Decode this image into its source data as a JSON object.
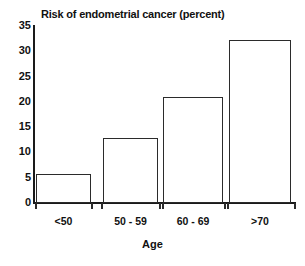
{
  "chart_data": {
    "type": "bar",
    "title": "Risk of endometrial cancer (percent)",
    "xlabel": "Age",
    "ylabel": "",
    "categories": [
      "<50",
      "50 - 59",
      "60 - 69",
      ">70"
    ],
    "values": [
      5.7,
      12.8,
      21.0,
      32.3
    ],
    "ylim": [
      0,
      35
    ],
    "yticks": [
      "0",
      "5",
      "10",
      "15",
      "20",
      "25",
      "30",
      "35"
    ],
    "ytick_values": [
      0,
      5,
      10,
      15,
      20,
      25,
      30,
      35
    ],
    "grid": false,
    "legend": false,
    "bar_fill_color": "#ffffff",
    "bar_edge_color": "#2b2b2b",
    "axis_color": "#1a1a1a",
    "background_color": "#ffffff"
  }
}
